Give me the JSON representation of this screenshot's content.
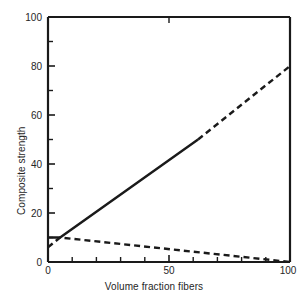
{
  "chart_data": {
    "type": "line",
    "title": "",
    "xlabel": "Volume fraction fibers",
    "ylabel": "Composite strength",
    "xlim": [
      0,
      100
    ],
    "ylim": [
      0,
      100
    ],
    "grid": false,
    "legend": "none",
    "x_major_ticks": [
      0,
      50,
      100
    ],
    "x_major_tick_labels": [
      "0",
      "50",
      "100"
    ],
    "x_minor_ticks": [
      10,
      20,
      30,
      40,
      60,
      70,
      80,
      90
    ],
    "y_major_ticks": [
      0,
      20,
      40,
      60,
      80,
      100
    ],
    "y_major_tick_labels": [
      "0",
      "20",
      "40",
      "60",
      "80",
      "100"
    ],
    "y_minor_ticks": [
      10,
      30,
      50,
      70,
      90
    ],
    "series": [
      {
        "name": "composite-strength",
        "style": "solid",
        "color": "#1a1a1a",
        "x": [
          0,
          5,
          62
        ],
        "y": [
          10,
          10,
          50
        ]
      },
      {
        "name": "composite-strength-extrapolated",
        "style": "dashed",
        "color": "#1a1a1a",
        "x": [
          62,
          100
        ],
        "y": [
          50,
          80
        ]
      },
      {
        "name": "matrix-contribution",
        "style": "dashed",
        "color": "#1a1a1a",
        "x": [
          0,
          5,
          100
        ],
        "y": [
          6,
          10,
          0
        ]
      }
    ]
  },
  "axes": {
    "x_label": "Volume fraction fibers",
    "y_label": "Composite strength"
  }
}
